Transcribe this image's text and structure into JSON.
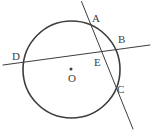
{
  "figure": {
    "background_color": "#ffffff",
    "stroke_color": "#3d3d3d",
    "label_color": "#3d3d3d",
    "circle": {
      "name": "circle-O",
      "center_x": 71.5,
      "center_y": 69.5,
      "radius": 48.5,
      "stroke_width": 1.6
    },
    "center_dot": {
      "name": "center-point-dot",
      "x": 71,
      "y": 69,
      "radius": 1.5
    },
    "lines": [
      {
        "name": "secant-line-DB",
        "x1": 3,
        "y1": 65,
        "x2": 150,
        "y2": 45,
        "stroke_width": 1.0
      },
      {
        "name": "secant-line-AC",
        "x1": 81.5,
        "y1": 1.5,
        "x2": 133,
        "y2": 129,
        "stroke_width": 1.0
      }
    ],
    "labels": [
      {
        "name": "label-A",
        "text": "A",
        "x": 92,
        "y": 13
      },
      {
        "name": "label-B",
        "text": "B",
        "x": 118,
        "y": 34
      },
      {
        "name": "label-E",
        "text": "E",
        "x": 94,
        "y": 57
      },
      {
        "name": "label-D",
        "text": "D",
        "x": 12,
        "y": 51
      },
      {
        "name": "label-O",
        "text": "O",
        "x": 68,
        "y": 73
      },
      {
        "name": "label-C",
        "text": "C",
        "x": 117,
        "y": 84
      }
    ]
  }
}
